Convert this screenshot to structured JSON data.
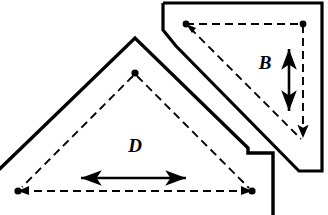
{
  "figure": {
    "background_color": "#ffffff",
    "line_color": "#000000",
    "width": 328,
    "height": 215,
    "shapes": [
      {
        "id": "plate-d",
        "name": "large-triangular-plate",
        "label": "D",
        "label_position": {
          "x": 135,
          "y": 152
        },
        "outline_style": "solid",
        "outline_width": 3.2,
        "outline_points": "-14,182 135,38 247,147 247,152 273,152 273,215",
        "inner_style": "dashed",
        "inner_width": 1.8,
        "inner_points": "17,190 135,73 253,190 17,190",
        "vertex_dots": [
          {
            "x": 135,
            "y": 73
          }
        ],
        "arrow_vertices": [
          {
            "x": 17,
            "y": 190
          },
          {
            "x": 253,
            "y": 190
          }
        ],
        "dimension_arrow": {
          "name": "d-dimension-arrow",
          "orientation": "horizontal",
          "double_headed": true,
          "x1": 79,
          "y1": 178,
          "x2": 188,
          "y2": 178
        }
      },
      {
        "id": "plate-b",
        "name": "small-triangular-plate",
        "label": "B",
        "label_position": {
          "x": 265,
          "y": 69
        },
        "outline_style": "solid",
        "outline_width": 3.2,
        "outline_points": "163,3 322,3 322,171 299,171 175,45 163,29 163,3",
        "inner_style": "dashed",
        "inner_width": 1.8,
        "inner_points": "185,24 303,24 303,141 185,24",
        "vertex_dots": [
          {
            "x": 185,
            "y": 24
          },
          {
            "x": 303,
            "y": 24
          }
        ],
        "arrow_vertices": [
          {
            "x": 303,
            "y": 141
          }
        ],
        "dimension_arrow": {
          "name": "b-dimension-arrow",
          "orientation": "vertical",
          "double_headed": true,
          "x1": 289,
          "y1": 47,
          "x2": 289,
          "y2": 113
        }
      }
    ],
    "labels": [
      {
        "name": "label-d",
        "text": "D"
      },
      {
        "name": "label-b",
        "text": "B"
      }
    ]
  }
}
